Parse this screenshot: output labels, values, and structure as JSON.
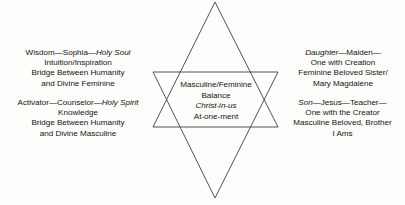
{
  "diagram": {
    "background_color": "#fdfdfc",
    "line_color": "#3f3f3f",
    "text_color": "#131313",
    "star": {
      "name": "six-pointed-star",
      "downward_triangle": {
        "apex": [
          215,
          2
        ],
        "left": [
          153,
          127
        ],
        "right": [
          278,
          127
        ]
      },
      "upward_triangle": {
        "apex": [
          215,
          198
        ],
        "left": [
          153,
          72
        ],
        "right": [
          278,
          72
        ]
      }
    },
    "center": {
      "lines": [
        "Masculine/Feminine",
        "Balance",
        "Christ-in-us",
        "At-one-ment"
      ],
      "italic_line": "Christ-in-us"
    },
    "upper_left": {
      "heading_plain_1": "Wisdom—Sophia—",
      "heading_italic": "Holy Soul",
      "lines": [
        "Intuition/Inspiration",
        "Bridge Between Humanity",
        "and Divine Feminine"
      ]
    },
    "lower_left": {
      "heading_plain_1": "Activator—Counselor—",
      "heading_italic": "Holy Spirit",
      "lines": [
        "Knowledge",
        "Bridge Between Humanity",
        "and Divine Masculine"
      ]
    },
    "upper_right": {
      "heading_italic": "Daughter",
      "heading_plain_1": "—Maiden—",
      "lines": [
        "One with Creation",
        "Feminine Beloved Sister/",
        "Mary Magdalene"
      ]
    },
    "lower_right": {
      "heading_italic": "Son",
      "heading_plain_1": "—Jesus—Teacher—",
      "lines": [
        "One with the Creator",
        "Masculine Beloved, Brother",
        "I Ams"
      ]
    }
  }
}
